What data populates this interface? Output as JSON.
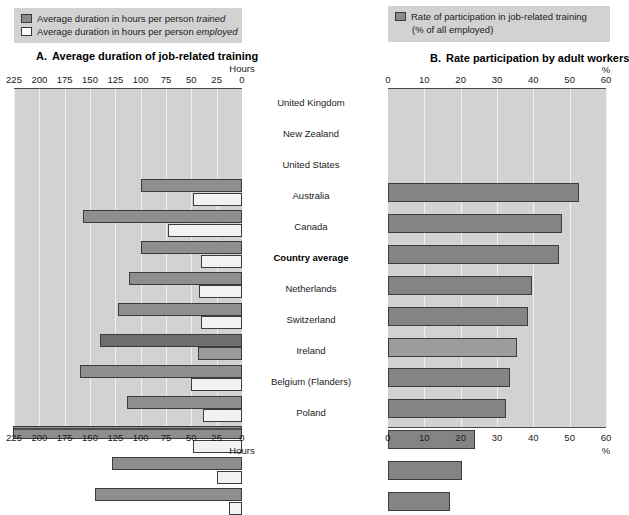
{
  "panel_a": {
    "legend": [
      {
        "swatch": "filled",
        "text_plain": "Average duration in hours per person ",
        "text_italic": "trained"
      },
      {
        "swatch": "hollow",
        "text_plain": "Average duration in hours per person ",
        "text_italic": "employed"
      }
    ],
    "letter": "A.",
    "title": "Average duration of job-related training",
    "axis_unit_top": "Hours",
    "axis_unit_bottom": "Hours",
    "ticks": [
      225,
      200,
      175,
      150,
      125,
      100,
      75,
      50,
      25,
      0
    ]
  },
  "panel_b": {
    "legend": [
      {
        "swatch": "filled",
        "text_plain": "Rate of participation in job-related training",
        "text_sub": "(% of all employed)"
      }
    ],
    "letter": "B.",
    "title": "Rate participation by adult workers",
    "axis_unit_top": "%",
    "axis_unit_bottom": "%",
    "ticks": [
      0,
      10,
      20,
      30,
      40,
      50,
      60
    ]
  },
  "countries": [
    "United Kingdom",
    "New Zealand",
    "United States",
    "Australia",
    "Canada",
    "Country average",
    "Netherlands",
    "Switzerland",
    "Ireland",
    "Belgium (Flanders)",
    "Poland"
  ],
  "emphasized_country": "Country average",
  "colors": {
    "plot_background": "#d2d2d2",
    "legend_background": "#d2d2d2",
    "bar_trained": "#8e8e8e",
    "bar_employed": "#f2f2f2",
    "bar_rate": "#848484",
    "bar_average_accent": "#6f6f6f",
    "axis_line": "#4a4a4a",
    "gridline": "#f0f0f0",
    "text": "#1b1b1b"
  },
  "chart_data": [
    {
      "type": "bar",
      "id": "panel-a",
      "orientation": "horizontal",
      "direction": "right-to-left",
      "title": "A.  Average duration of job-related training",
      "xlabel": "Hours",
      "ylabel": "",
      "xlim": [
        0,
        225
      ],
      "xticks": [
        225,
        200,
        175,
        150,
        125,
        100,
        75,
        50,
        25,
        0
      ],
      "grid": true,
      "legend_position": "above-plot",
      "categories": [
        "United Kingdom",
        "New Zealand",
        "United States",
        "Australia",
        "Canada",
        "Country average",
        "Netherlands",
        "Switzerland",
        "Ireland",
        "Belgium (Flanders)",
        "Poland"
      ],
      "series": [
        {
          "name": "Average duration in hours per person trained",
          "values": [
            100,
            157,
            100,
            112,
            122,
            140,
            160,
            113,
            226,
            128,
            145
          ]
        },
        {
          "name": "Average duration in hours per person employed",
          "values": [
            48,
            73,
            40,
            42,
            40,
            43,
            50,
            38,
            48,
            25,
            13
          ]
        }
      ]
    },
    {
      "type": "bar",
      "id": "panel-b",
      "orientation": "horizontal",
      "direction": "left-to-right",
      "title": "B.  Rate participation by adult workers",
      "xlabel": "%",
      "ylabel": "",
      "xlim": [
        0,
        60
      ],
      "xticks": [
        0,
        10,
        20,
        30,
        40,
        50,
        60
      ],
      "grid": true,
      "legend_position": "above-plot",
      "categories": [
        "United Kingdom",
        "New Zealand",
        "United States",
        "Australia",
        "Canada",
        "Country average",
        "Netherlands",
        "Switzerland",
        "Ireland",
        "Belgium (Flanders)",
        "Poland"
      ],
      "series": [
        {
          "name": "Rate of participation in job-related training (% of all employed)",
          "values": [
            52.5,
            48,
            47,
            39.5,
            38.5,
            35.5,
            33.5,
            32.5,
            24,
            20.5,
            17
          ]
        }
      ]
    }
  ]
}
